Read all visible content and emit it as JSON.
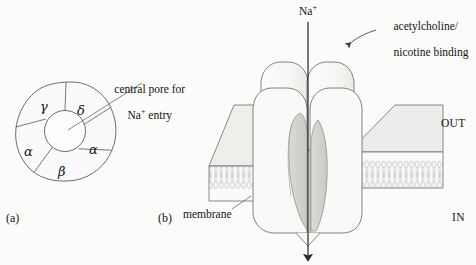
{
  "figure": {
    "background_color": "#fbfbfa",
    "line_color": "#4a4a4a",
    "fill_light": "#f4f4f2",
    "fill_mid": "#e3e3e0",
    "fill_dark": "#d2d2cf"
  },
  "panels": {
    "a": {
      "tag": "(a)",
      "description": "top-down pentameric subunit arrangement",
      "subunits": [
        {
          "label": "γ",
          "name": "gamma"
        },
        {
          "label": "δ",
          "name": "delta"
        },
        {
          "label": "α",
          "name": "alpha-right"
        },
        {
          "label": "β",
          "name": "beta"
        },
        {
          "label": "α",
          "name": "alpha-left"
        }
      ],
      "callout": {
        "line1": "central pore for",
        "line2_pre": "Na",
        "line2_sup": "+",
        "line2_post": " entry"
      }
    },
    "b": {
      "tag": "(b)",
      "description": "side cut-away view of the receptor in the membrane",
      "ion_label": {
        "text": "Na",
        "sup": "+"
      },
      "binding_callout": {
        "line1": "acetylcholine/",
        "line2": "nicotine binding"
      },
      "membrane_label": "membrane",
      "side_out": "OUT",
      "side_in": "IN"
    }
  }
}
